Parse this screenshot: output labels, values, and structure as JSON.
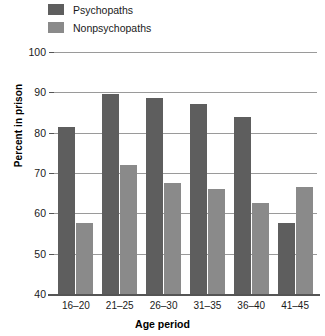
{
  "chart_data": {
    "type": "bar",
    "title": "",
    "xlabel": "Age period",
    "ylabel": "Percent in prison",
    "categories": [
      "16–20",
      "21–25",
      "26–30",
      "31–35",
      "36–40",
      "41–45"
    ],
    "series": [
      {
        "name": "Psychopaths",
        "values": [
          81.5,
          89.5,
          88.5,
          87,
          84,
          57.5
        ],
        "color": "#5e5e5e"
      },
      {
        "name": "Nonpsychopaths",
        "values": [
          57.5,
          72,
          67.5,
          66,
          62.5,
          66.5
        ],
        "color": "#8a8a8a"
      }
    ],
    "ylim": [
      40,
      100
    ],
    "yticks": [
      40,
      50,
      60,
      70,
      80,
      90,
      100
    ],
    "ytick_labels": [
      "40",
      "50",
      "60",
      "70",
      "80",
      "90",
      "100"
    ],
    "grid": true,
    "legend_position": "top-left"
  },
  "legend": {
    "items": [
      {
        "label": "Psychopaths",
        "color": "#5e5e5e"
      },
      {
        "label": "Nonpsychopaths",
        "color": "#8a8a8a"
      }
    ]
  },
  "axes": {
    "y_axis_label": "Percent in prison",
    "x_axis_label": "Age period"
  },
  "colors": {
    "psychopaths": "#5e5e5e",
    "nonpsychopaths": "#8a8a8a",
    "gridline": "#9a9a9a",
    "axis": "#555555",
    "background": "#ffffff"
  }
}
